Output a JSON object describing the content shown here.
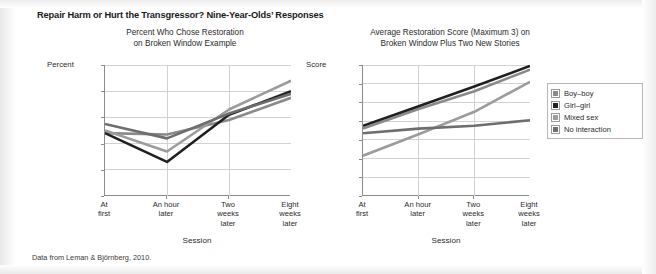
{
  "figure": {
    "title": "Repair Harm or Hurt the Transgressor? Nine-Year-Olds’ Responses",
    "source_note": "Data from Leman & Björnberg, 2010."
  },
  "legend": {
    "position": "right",
    "items": [
      {
        "label": "Boy–boy",
        "color": "#8a8a8a"
      },
      {
        "label": "Girl–girl",
        "color": "#231f20"
      },
      {
        "label": "Mixed sex",
        "color": "#9c9c9c"
      },
      {
        "label": "No interaction",
        "color": "#6e6e6e"
      }
    ]
  },
  "chart_data": [
    {
      "type": "line",
      "title": "Percent Who Chose Restoration\non Broken Window Example",
      "title_line1": "Percent Who Chose Restoration",
      "title_line2": "on Broken Window Example",
      "ylabel": "Percent",
      "xlabel": "Session",
      "ylim": [
        0,
        100
      ],
      "yticks": [
        0,
        20,
        40,
        60,
        80,
        100
      ],
      "ytick_labels": [
        "0",
        "20",
        "40",
        "60",
        "80",
        "100"
      ],
      "grid": true,
      "categories": [
        "At first",
        "An hour later",
        "Two weeks later",
        "Eight weeks later"
      ],
      "category_lines": [
        [
          "At",
          "first"
        ],
        [
          "An hour",
          "later"
        ],
        [
          "Two",
          "weeks",
          "later"
        ],
        [
          "Eight",
          "weeks",
          "later"
        ]
      ],
      "series": [
        {
          "name": "Boy–boy",
          "color": "#8a8a8a",
          "values": [
            48,
            47,
            58,
            75
          ]
        },
        {
          "name": "Girl–girl",
          "color": "#231f20",
          "values": [
            48,
            26,
            62,
            80
          ]
        },
        {
          "name": "Mixed sex",
          "color": "#9c9c9c",
          "values": [
            50,
            34,
            66,
            88
          ]
        },
        {
          "name": "No interaction",
          "color": "#6e6e6e",
          "values": [
            55,
            44,
            63,
            78
          ]
        }
      ]
    },
    {
      "type": "line",
      "title": "Average Restoration Score (Maximum 3) on\nBroken Window Plus Two New Stories",
      "title_line1": "Average Restoration Score (Maximum 3) on",
      "title_line2": "Broken Window Plus Two New Stories",
      "ylabel": "Score",
      "xlabel": "Session",
      "ylim": [
        1.5,
        2.9
      ],
      "yticks": [
        1.5,
        1.7,
        1.9,
        2.1,
        2.3,
        2.5,
        2.7,
        2.9
      ],
      "ytick_labels": [
        "1.5",
        "1.7",
        "1.9",
        "2.1",
        "2.3",
        "2.5",
        "2.7",
        "2.9"
      ],
      "grid": true,
      "categories": [
        "At first",
        "An hour later",
        "Two weeks later",
        "Eight weeks later"
      ],
      "category_lines": [
        [
          "At",
          "first"
        ],
        [
          "An hour",
          "later"
        ],
        [
          "Two",
          "weeks",
          "later"
        ],
        [
          "Eight",
          "weeks",
          "later"
        ]
      ],
      "series": [
        {
          "name": "Boy–boy",
          "color": "#8a8a8a",
          "values": [
            2.22,
            2.43,
            2.62,
            2.85
          ]
        },
        {
          "name": "Girl–girl",
          "color": "#231f20",
          "values": [
            2.25,
            2.46,
            2.67,
            2.89
          ]
        },
        {
          "name": "Mixed sex",
          "color": "#9c9c9c",
          "values": [
            1.93,
            2.16,
            2.4,
            2.72
          ]
        },
        {
          "name": "No interaction",
          "color": "#6e6e6e",
          "values": [
            2.17,
            2.22,
            2.25,
            2.31
          ]
        }
      ]
    }
  ]
}
